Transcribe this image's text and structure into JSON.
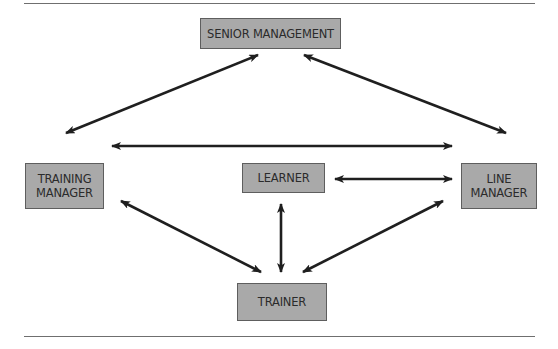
{
  "diagram": {
    "nodes": {
      "senior_management": {
        "label": "SENIOR MANAGEMENT"
      },
      "training_manager": {
        "line1": "TRAINING",
        "line2": "MANAGER"
      },
      "line_manager": {
        "line1": "LINE",
        "line2": "MANAGER"
      },
      "learner": {
        "label": "LEARNER"
      },
      "trainer": {
        "label": "TRAINER"
      }
    },
    "edges": [
      {
        "from": "SENIOR MANAGEMENT",
        "to": "TRAINING MANAGER",
        "type": "bidirectional"
      },
      {
        "from": "SENIOR MANAGEMENT",
        "to": "LINE MANAGER",
        "type": "bidirectional"
      },
      {
        "from": "TRAINING MANAGER",
        "to": "LINE MANAGER",
        "type": "bidirectional"
      },
      {
        "from": "LEARNER",
        "to": "LINE MANAGER",
        "type": "bidirectional"
      },
      {
        "from": "LEARNER",
        "to": "TRAINER",
        "type": "bidirectional"
      },
      {
        "from": "TRAINING MANAGER",
        "to": "TRAINER",
        "type": "bidirectional"
      },
      {
        "from": "LINE MANAGER",
        "to": "TRAINER",
        "type": "bidirectional"
      }
    ],
    "colors": {
      "node_fill": "#a9a9a9",
      "node_border": "#5e5e5e",
      "arrow": "#1f1f1f",
      "rule": "#6f6f6f"
    }
  }
}
